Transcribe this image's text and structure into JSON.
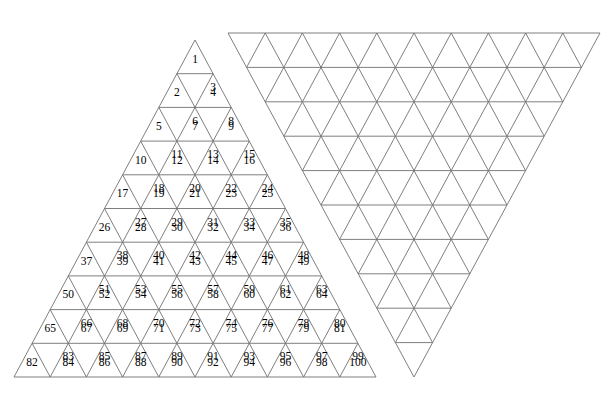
{
  "figure": {
    "background_color": "#ffffff",
    "line_color": "#707070",
    "text_color": "#000000",
    "left_triangle": {
      "orientation": "up",
      "rows": 10,
      "numbered": true,
      "apex": {
        "x": 195,
        "y": 40
      },
      "bottom_left": {
        "x": 14,
        "y": 377
      },
      "bottom_right": {
        "x": 376,
        "y": 377
      },
      "row_numbers": [
        [
          1
        ],
        [
          2,
          3,
          4
        ],
        [
          5,
          6,
          7,
          8,
          9
        ],
        [
          10,
          11,
          12,
          13,
          14,
          15,
          16
        ],
        [
          17,
          18,
          19,
          20,
          21,
          22,
          23,
          24,
          25
        ],
        [
          26,
          27,
          28,
          29,
          30,
          31,
          32,
          33,
          34,
          35,
          36
        ],
        [
          37,
          38,
          39,
          40,
          41,
          42,
          43,
          44,
          45,
          46,
          47,
          48,
          49
        ],
        [
          50,
          51,
          52,
          53,
          54,
          55,
          56,
          57,
          58,
          59,
          60,
          61,
          62,
          63,
          64
        ],
        [
          65,
          66,
          67,
          68,
          69,
          70,
          71,
          72,
          73,
          74,
          75,
          76,
          77,
          78,
          79,
          80,
          81
        ],
        [
          82,
          83,
          84,
          85,
          86,
          87,
          88,
          89,
          90,
          91,
          92,
          93,
          94,
          95,
          96,
          97,
          98,
          99,
          100
        ]
      ]
    },
    "right_triangle": {
      "orientation": "down",
      "rows": 10,
      "numbered": false,
      "top_left": {
        "x": 228,
        "y": 33
      },
      "top_right": {
        "x": 600,
        "y": 33
      },
      "apex": {
        "x": 414,
        "y": 377
      }
    }
  }
}
